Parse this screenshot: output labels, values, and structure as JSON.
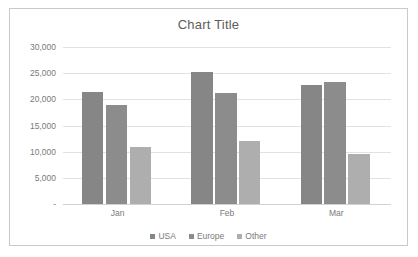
{
  "chart_data": {
    "type": "bar",
    "title": "Chart Title",
    "xlabel": "",
    "ylabel": "",
    "categories": [
      "Jan",
      "Feb",
      "Mar"
    ],
    "series": [
      {
        "name": "USA",
        "color": "#868686",
        "values": [
          21400,
          25300,
          22700
        ]
      },
      {
        "name": "Europe",
        "color": "#8c8c8c",
        "values": [
          19000,
          21200,
          23400
        ]
      },
      {
        "name": "Other",
        "color": "#aeaeae",
        "values": [
          10800,
          12100,
          9600
        ]
      }
    ],
    "ylim": [
      0,
      30000
    ],
    "ytick_values": [
      30000,
      25000,
      20000,
      15000,
      10000,
      5000,
      0
    ],
    "ytick_labels": [
      "30,000",
      "25,000",
      "20,000",
      "15,000",
      "10,000",
      "5,000",
      "-"
    ],
    "grid": true,
    "legend_position": "bottom"
  }
}
